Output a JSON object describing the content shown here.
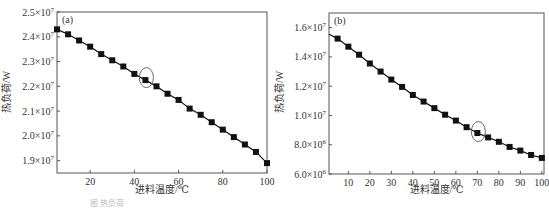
{
  "chart_data": [
    {
      "type": "line",
      "panel_label": "(a)",
      "title": "",
      "xlabel": "进料温度/℃",
      "ylabel": "热负荷/W",
      "xlim": [
        5,
        100
      ],
      "ylim": [
        18500000.0,
        25000000.0
      ],
      "xticks": [
        20,
        40,
        60,
        80,
        100
      ],
      "xtick_labels": [
        "20",
        "40",
        "60",
        "80",
        "100"
      ],
      "yticks": [
        19000000.0,
        20000000.0,
        21000000.0,
        22000000.0,
        23000000.0,
        24000000.0,
        25000000.0
      ],
      "ytick_labels": [
        {
          "mant": "1.9×10",
          "exp": "7"
        },
        {
          "mant": "2.0×10",
          "exp": "7"
        },
        {
          "mant": "2.1×10",
          "exp": "7"
        },
        {
          "mant": "2.2×10",
          "exp": "7"
        },
        {
          "mant": "2.3×10",
          "exp": "7"
        },
        {
          "mant": "2.4×10",
          "exp": "7"
        },
        {
          "mant": "2.5×10",
          "exp": "7"
        }
      ],
      "grid": false,
      "marker": "square",
      "highlight": {
        "x": 45,
        "y": 22350000.0,
        "shape": "ellipse"
      },
      "x": [
        5,
        10,
        15,
        20,
        25,
        30,
        35,
        40,
        45,
        50,
        55,
        60,
        65,
        70,
        75,
        80,
        85,
        90,
        95,
        100
      ],
      "series": [
        {
          "name": "热负荷",
          "values": [
            24300000.0,
            24100000.0,
            23850000.0,
            23600000.0,
            23300000.0,
            23050000.0,
            22800000.0,
            22500000.0,
            22250000.0,
            22000000.0,
            21700000.0,
            21450000.0,
            21100000.0,
            20850000.0,
            20550000.0,
            20250000.0,
            19950000.0,
            19650000.0,
            19350000.0,
            18900000.0
          ]
        }
      ]
    },
    {
      "type": "line",
      "panel_label": "(b)",
      "title": "",
      "xlabel": "进料温度/℃",
      "ylabel": "热负荷/W",
      "xlim": [
        1,
        101
      ],
      "ylim": [
        6000000.0,
        17000000.0
      ],
      "xticks": [
        10,
        20,
        30,
        40,
        50,
        60,
        70,
        80,
        90,
        100
      ],
      "xtick_labels": [
        "10",
        "20",
        "30",
        "40",
        "50",
        "60",
        "70",
        "80",
        "90",
        "100"
      ],
      "yticks": [
        6000000.0,
        8000000.0,
        10000000.0,
        12000000.0,
        14000000.0,
        16000000.0
      ],
      "ytick_labels": [
        {
          "mant": "6.0×10",
          "exp": "6"
        },
        {
          "mant": "8.0×10",
          "exp": "6"
        },
        {
          "mant": "1.0×10",
          "exp": "7"
        },
        {
          "mant": "1.2×10",
          "exp": "7"
        },
        {
          "mant": "1.4×10",
          "exp": "7"
        },
        {
          "mant": "1.6×10",
          "exp": "7"
        }
      ],
      "grid": false,
      "marker": "square",
      "highlight": {
        "x": 70,
        "y": 8900000.0,
        "shape": "ellipse"
      },
      "x": [
        5,
        10,
        15,
        20,
        25,
        30,
        35,
        40,
        45,
        50,
        55,
        60,
        65,
        70,
        75,
        80,
        85,
        90,
        95,
        100
      ],
      "series": [
        {
          "name": "热负荷",
          "values": [
            15250000.0,
            14700000.0,
            14150000.0,
            13550000.0,
            13000000.0,
            12450000.0,
            11950000.0,
            11400000.0,
            10950000.0,
            10500000.0,
            10050000.0,
            9650000.0,
            9200000.0,
            8800000.0,
            8500000.0,
            8200000.0,
            7850000.0,
            7600000.0,
            7300000.0,
            7100000.0
          ]
        }
      ]
    }
  ],
  "caption": "图  热负荷"
}
